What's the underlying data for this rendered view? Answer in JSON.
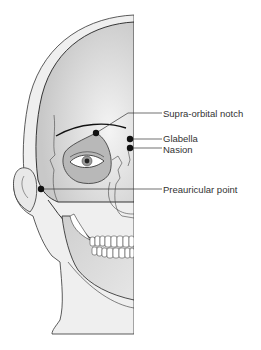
{
  "figure": {
    "colors": {
      "skin": "#eeeeee",
      "bone": "#d9d9d9",
      "orbit": "#bdbdbd",
      "outline": "#222222",
      "landmark": "#111111",
      "label_text": "#333333"
    }
  },
  "landmarks": [
    {
      "id": "supra-orbital-notch",
      "label": "Supra-orbital notch"
    },
    {
      "id": "glabella",
      "label": "Glabella"
    },
    {
      "id": "nasion",
      "label": "Nasion"
    },
    {
      "id": "preauricular-point",
      "label": "Preauricular point"
    }
  ]
}
